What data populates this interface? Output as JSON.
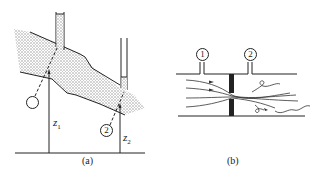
{
  "figure_a": {
    "caption": "(a)",
    "point_1_label": "",
    "point_2_label": "2",
    "z1_var": "z",
    "z1_sub": "1",
    "z2_var": "z",
    "z2_sub": "2"
  },
  "figure_b": {
    "caption": "(b)",
    "tap_1_label": "1",
    "tap_2_label": "2"
  },
  "colors": {
    "ink": "#222222",
    "fluid_fill": "#bdbdbd"
  }
}
